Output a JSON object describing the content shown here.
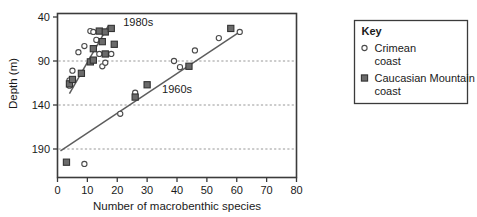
{
  "chart_data": {
    "type": "scatter",
    "title": "",
    "xlabel": "Number of macrobenthic species",
    "ylabel": "Depth (m)",
    "xlim": [
      0,
      80
    ],
    "ylim": [
      40,
      215
    ],
    "y_inverted": true,
    "xticks": [
      0,
      10,
      20,
      30,
      40,
      50,
      60,
      70,
      80
    ],
    "yticks": [
      40,
      90,
      140,
      190
    ],
    "grid": "horizontal-dashed",
    "legend_position": "right-outside",
    "series": [
      {
        "name": "Crimean coast",
        "marker": "open-circle",
        "color": "#555555",
        "points": [
          [
            4,
            112
          ],
          [
            4,
            118
          ],
          [
            5,
            101
          ],
          [
            7,
            80
          ],
          [
            9,
            73
          ],
          [
            9,
            207
          ],
          [
            11,
            56
          ],
          [
            12,
            57
          ],
          [
            13,
            66
          ],
          [
            14,
            82
          ],
          [
            15,
            96
          ],
          [
            16,
            92
          ],
          [
            18,
            82
          ],
          [
            21,
            150
          ],
          [
            26,
            126
          ],
          [
            39,
            90
          ],
          [
            41,
            97
          ],
          [
            46,
            78
          ],
          [
            54,
            64
          ],
          [
            61,
            57
          ]
        ]
      },
      {
        "name": "Caucasian Mountain coast",
        "marker": "filled-square",
        "color": "#5a5a5a",
        "points": [
          [
            3,
            205
          ],
          [
            4,
            116
          ],
          [
            5,
            111
          ],
          [
            8,
            104
          ],
          [
            11,
            91
          ],
          [
            12,
            89
          ],
          [
            12,
            76
          ],
          [
            14,
            56
          ],
          [
            15,
            68
          ],
          [
            16,
            82
          ],
          [
            16,
            57
          ],
          [
            18,
            53
          ],
          [
            19,
            71
          ],
          [
            26,
            131
          ],
          [
            30,
            117
          ],
          [
            44,
            96
          ],
          [
            58,
            53
          ]
        ]
      }
    ],
    "trendlines": [
      {
        "label": "1980s",
        "x0": 4,
        "y0": 127,
        "x1": 17,
        "y1": 50,
        "label_x": 22,
        "label_y": 50
      },
      {
        "label": "1960s",
        "x0": 1,
        "y0": 192,
        "x1": 61,
        "y1": 57,
        "label_x": 35,
        "label_y": 126
      }
    ]
  },
  "legend": {
    "title": "Key",
    "entries": [
      {
        "marker": "open-circle",
        "line1": "Crimean",
        "line2": "coast"
      },
      {
        "marker": "filled-square",
        "line1": "Caucasian Mountain",
        "line2": "coast"
      }
    ]
  }
}
